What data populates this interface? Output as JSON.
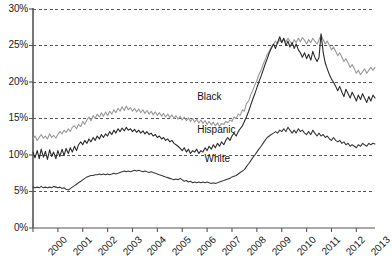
{
  "chart_data": {
    "type": "line",
    "title": "",
    "subtitle": "",
    "xlabel": "",
    "ylabel": "",
    "xlim": [
      2000,
      2013.75
    ],
    "ylim": [
      0,
      30
    ],
    "y_tick_labels": [
      "0%",
      "5%",
      "10%",
      "15%",
      "20%",
      "25%",
      "30%"
    ],
    "y_tick_values": [
      0,
      5,
      10,
      15,
      20,
      25,
      30
    ],
    "x_tick_labels": [
      "2000",
      "2001",
      "2002",
      "2003",
      "2004",
      "2005",
      "2006",
      "2007",
      "2008",
      "2009",
      "2010",
      "2011",
      "2012",
      "2013"
    ],
    "x_tick_values": [
      2000,
      2001,
      2002,
      2003,
      2004,
      2005,
      2006,
      2007,
      2008,
      2009,
      2010,
      2011,
      2012,
      2013
    ],
    "grid": "horizontal-dashed",
    "legend": "inline-labels",
    "colors": {
      "black_series": "#9a9a9a",
      "hispanic_series": "#2b2b2b",
      "white_series": "#3a3a3a",
      "axis": "#555555",
      "grid": "#444444"
    },
    "annotations": [
      {
        "text": "Black",
        "x": 2006.6,
        "y": 17.9
      },
      {
        "text": "Hispanic",
        "x": 2006.6,
        "y": 13.4
      },
      {
        "text": "White",
        "x": 2006.9,
        "y": 9.4
      }
    ],
    "series": [
      {
        "name": "Black",
        "color": "#9a9a9a",
        "x": [
          2000.0,
          2000.08,
          2000.17,
          2000.25,
          2000.33,
          2000.42,
          2000.5,
          2000.58,
          2000.67,
          2000.75,
          2000.83,
          2000.92,
          2001.0,
          2001.08,
          2001.17,
          2001.25,
          2001.33,
          2001.42,
          2001.5,
          2001.58,
          2001.67,
          2001.75,
          2001.83,
          2001.92,
          2002.0,
          2002.08,
          2002.17,
          2002.25,
          2002.33,
          2002.42,
          2002.5,
          2002.58,
          2002.67,
          2002.75,
          2002.83,
          2002.92,
          2003.0,
          2003.08,
          2003.17,
          2003.25,
          2003.33,
          2003.42,
          2003.5,
          2003.58,
          2003.67,
          2003.75,
          2003.83,
          2003.92,
          2004.0,
          2004.08,
          2004.17,
          2004.25,
          2004.33,
          2004.42,
          2004.5,
          2004.58,
          2004.67,
          2004.75,
          2004.83,
          2004.92,
          2005.0,
          2005.08,
          2005.17,
          2005.25,
          2005.33,
          2005.42,
          2005.5,
          2005.58,
          2005.67,
          2005.75,
          2005.83,
          2005.92,
          2006.0,
          2006.08,
          2006.17,
          2006.25,
          2006.33,
          2006.42,
          2006.5,
          2006.58,
          2006.67,
          2006.75,
          2006.83,
          2006.92,
          2007.0,
          2007.08,
          2007.17,
          2007.25,
          2007.33,
          2007.42,
          2007.5,
          2007.58,
          2007.67,
          2007.75,
          2007.83,
          2007.92,
          2008.0,
          2008.08,
          2008.17,
          2008.25,
          2008.33,
          2008.42,
          2008.5,
          2008.58,
          2008.67,
          2008.75,
          2008.83,
          2008.92,
          2009.0,
          2009.08,
          2009.17,
          2009.25,
          2009.33,
          2009.42,
          2009.5,
          2009.58,
          2009.67,
          2009.75,
          2009.83,
          2009.92,
          2010.0,
          2010.08,
          2010.17,
          2010.25,
          2010.33,
          2010.42,
          2010.5,
          2010.58,
          2010.67,
          2010.75,
          2010.83,
          2010.92,
          2011.0,
          2011.08,
          2011.17,
          2011.25,
          2011.33,
          2011.42,
          2011.5,
          2011.58,
          2011.67,
          2011.75,
          2011.83,
          2011.92,
          2012.0,
          2012.08,
          2012.17,
          2012.25,
          2012.33,
          2012.42,
          2012.5,
          2012.58,
          2012.67,
          2012.75,
          2012.83,
          2012.92,
          2013.0,
          2013.08,
          2013.17,
          2013.25,
          2013.33,
          2013.42,
          2013.5,
          2013.58,
          2013.67,
          2013.75
        ],
        "y": [
          12.2,
          12.6,
          12.0,
          12.4,
          12.8,
          12.3,
          12.6,
          12.2,
          12.9,
          12.4,
          12.7,
          12.3,
          12.8,
          13.2,
          12.9,
          13.4,
          13.1,
          13.6,
          13.2,
          13.8,
          14.0,
          13.6,
          14.2,
          13.9,
          14.6,
          14.2,
          14.8,
          15.2,
          14.7,
          15.4,
          15.0,
          15.6,
          15.2,
          15.8,
          15.3,
          15.9,
          15.4,
          16.0,
          15.6,
          16.2,
          15.8,
          16.4,
          16.0,
          16.6,
          16.1,
          16.7,
          16.2,
          16.5,
          16.0,
          16.4,
          15.9,
          16.3,
          15.8,
          16.2,
          15.7,
          16.1,
          15.6,
          16.0,
          15.5,
          15.9,
          15.4,
          15.8,
          15.3,
          15.7,
          15.2,
          15.6,
          15.1,
          15.5,
          15.0,
          15.4,
          14.9,
          15.3,
          14.8,
          15.2,
          14.7,
          15.1,
          14.6,
          15.0,
          14.5,
          14.9,
          14.4,
          14.8,
          14.3,
          14.7,
          14.2,
          14.6,
          14.1,
          14.5,
          14.0,
          14.4,
          13.9,
          14.3,
          14.2,
          14.6,
          14.4,
          14.8,
          14.6,
          15.2,
          15.0,
          15.6,
          15.4,
          16.2,
          16.0,
          17.0,
          17.4,
          18.2,
          18.8,
          19.6,
          20.2,
          21.0,
          21.6,
          22.4,
          23.0,
          23.8,
          24.2,
          24.8,
          25.2,
          25.6,
          25.2,
          25.8,
          25.4,
          25.9,
          25.5,
          26.0,
          25.6,
          25.2,
          25.8,
          25.4,
          26.0,
          25.5,
          26.1,
          25.7,
          25.2,
          25.8,
          25.4,
          26.0,
          25.6,
          25.2,
          25.8,
          26.4,
          25.8,
          25.2,
          25.6,
          25.0,
          24.4,
          24.8,
          24.2,
          23.6,
          24.0,
          23.4,
          22.8,
          23.2,
          22.6,
          22.0,
          22.4,
          21.8,
          21.2,
          21.6,
          21.0,
          21.4,
          21.8,
          21.2,
          21.6,
          22.0,
          21.6,
          22.0
        ]
      },
      {
        "name": "Hispanic",
        "color": "#2b2b2b",
        "x": [
          2000.0,
          2000.08,
          2000.17,
          2000.25,
          2000.33,
          2000.42,
          2000.5,
          2000.58,
          2000.67,
          2000.75,
          2000.83,
          2000.92,
          2001.0,
          2001.08,
          2001.17,
          2001.25,
          2001.33,
          2001.42,
          2001.5,
          2001.58,
          2001.67,
          2001.75,
          2001.83,
          2001.92,
          2002.0,
          2002.08,
          2002.17,
          2002.25,
          2002.33,
          2002.42,
          2002.5,
          2002.58,
          2002.67,
          2002.75,
          2002.83,
          2002.92,
          2003.0,
          2003.08,
          2003.17,
          2003.25,
          2003.33,
          2003.42,
          2003.5,
          2003.58,
          2003.67,
          2003.75,
          2003.83,
          2003.92,
          2004.0,
          2004.08,
          2004.17,
          2004.25,
          2004.33,
          2004.42,
          2004.5,
          2004.58,
          2004.67,
          2004.75,
          2004.83,
          2004.92,
          2005.0,
          2005.08,
          2005.17,
          2005.25,
          2005.33,
          2005.42,
          2005.5,
          2005.58,
          2005.67,
          2005.75,
          2005.83,
          2005.92,
          2006.0,
          2006.08,
          2006.17,
          2006.25,
          2006.33,
          2006.42,
          2006.5,
          2006.58,
          2006.67,
          2006.75,
          2006.83,
          2006.92,
          2007.0,
          2007.08,
          2007.17,
          2007.25,
          2007.33,
          2007.42,
          2007.5,
          2007.58,
          2007.67,
          2007.75,
          2007.83,
          2007.92,
          2008.0,
          2008.08,
          2008.17,
          2008.25,
          2008.33,
          2008.42,
          2008.5,
          2008.58,
          2008.67,
          2008.75,
          2008.83,
          2008.92,
          2009.0,
          2009.08,
          2009.17,
          2009.25,
          2009.33,
          2009.42,
          2009.5,
          2009.58,
          2009.67,
          2009.75,
          2009.83,
          2009.92,
          2010.0,
          2010.08,
          2010.17,
          2010.25,
          2010.33,
          2010.42,
          2010.5,
          2010.58,
          2010.67,
          2010.75,
          2010.83,
          2010.92,
          2011.0,
          2011.08,
          2011.17,
          2011.25,
          2011.33,
          2011.42,
          2011.5,
          2011.58,
          2011.67,
          2011.75,
          2011.83,
          2011.92,
          2012.0,
          2012.08,
          2012.17,
          2012.25,
          2012.33,
          2012.42,
          2012.5,
          2012.58,
          2012.67,
          2012.75,
          2012.83,
          2012.92,
          2013.0,
          2013.08,
          2013.17,
          2013.25,
          2013.33,
          2013.42,
          2013.5,
          2013.58,
          2013.67,
          2013.75
        ],
        "y": [
          10.4,
          9.6,
          10.6,
          9.5,
          10.8,
          9.7,
          10.5,
          9.4,
          10.7,
          9.8,
          10.4,
          9.5,
          10.6,
          9.8,
          10.8,
          9.9,
          10.9,
          10.2,
          11.0,
          10.4,
          11.2,
          10.6,
          11.4,
          11.8,
          11.4,
          12.0,
          11.6,
          12.2,
          11.8,
          12.4,
          12.0,
          12.6,
          12.2,
          12.8,
          12.4,
          12.9,
          12.6,
          13.2,
          12.8,
          13.4,
          13.0,
          13.6,
          13.2,
          13.7,
          13.3,
          13.8,
          13.4,
          13.6,
          13.2,
          13.5,
          13.1,
          13.4,
          13.0,
          13.3,
          12.9,
          13.2,
          12.8,
          13.0,
          12.6,
          12.8,
          12.4,
          12.6,
          12.2,
          12.4,
          12.0,
          12.2,
          11.8,
          12.0,
          11.6,
          11.4,
          11.2,
          10.9,
          10.6,
          11.0,
          10.4,
          10.8,
          10.2,
          10.6,
          10.4,
          10.8,
          10.2,
          10.6,
          10.4,
          11.0,
          10.6,
          11.2,
          10.8,
          11.4,
          11.0,
          11.6,
          11.2,
          11.8,
          11.4,
          12.0,
          12.4,
          12.0,
          12.6,
          13.0,
          12.6,
          13.2,
          13.6,
          14.0,
          14.6,
          15.2,
          16.0,
          16.8,
          17.6,
          18.4,
          19.2,
          20.0,
          20.8,
          21.6,
          22.4,
          23.2,
          24.0,
          24.6,
          25.2,
          24.6,
          25.4,
          26.2,
          25.4,
          26.0,
          25.0,
          25.6,
          24.8,
          25.4,
          24.6,
          25.2,
          24.4,
          24.0,
          23.4,
          24.0,
          23.2,
          23.8,
          23.0,
          24.2,
          23.4,
          22.8,
          23.4,
          26.6,
          24.0,
          22.6,
          21.8,
          21.0,
          20.4,
          20.0,
          19.4,
          18.8,
          19.4,
          18.6,
          18.0,
          19.0,
          18.4,
          17.8,
          18.6,
          18.0,
          17.4,
          18.2,
          17.6,
          18.4,
          17.8,
          17.2,
          18.0,
          17.4,
          18.2,
          17.8
        ]
      },
      {
        "name": "White",
        "color": "#3a3a3a",
        "x": [
          2000.0,
          2000.08,
          2000.17,
          2000.25,
          2000.33,
          2000.42,
          2000.5,
          2000.58,
          2000.67,
          2000.75,
          2000.83,
          2000.92,
          2001.0,
          2001.08,
          2001.17,
          2001.25,
          2001.33,
          2001.42,
          2001.5,
          2001.58,
          2001.67,
          2001.75,
          2001.83,
          2001.92,
          2002.0,
          2002.08,
          2002.17,
          2002.25,
          2002.33,
          2002.42,
          2002.5,
          2002.58,
          2002.67,
          2002.75,
          2002.83,
          2002.92,
          2003.0,
          2003.08,
          2003.17,
          2003.25,
          2003.33,
          2003.42,
          2003.5,
          2003.58,
          2003.67,
          2003.75,
          2003.83,
          2003.92,
          2004.0,
          2004.08,
          2004.17,
          2004.25,
          2004.33,
          2004.42,
          2004.5,
          2004.58,
          2004.67,
          2004.75,
          2004.83,
          2004.92,
          2005.0,
          2005.08,
          2005.17,
          2005.25,
          2005.33,
          2005.42,
          2005.5,
          2005.58,
          2005.67,
          2005.75,
          2005.83,
          2005.92,
          2006.0,
          2006.08,
          2006.17,
          2006.25,
          2006.33,
          2006.42,
          2006.5,
          2006.58,
          2006.67,
          2006.75,
          2006.83,
          2006.92,
          2007.0,
          2007.08,
          2007.17,
          2007.25,
          2007.33,
          2007.42,
          2007.5,
          2007.58,
          2007.67,
          2007.75,
          2007.83,
          2007.92,
          2008.0,
          2008.08,
          2008.17,
          2008.25,
          2008.33,
          2008.42,
          2008.5,
          2008.58,
          2008.67,
          2008.75,
          2008.83,
          2008.92,
          2009.0,
          2009.08,
          2009.17,
          2009.25,
          2009.33,
          2009.42,
          2009.5,
          2009.58,
          2009.67,
          2009.75,
          2009.83,
          2009.92,
          2010.0,
          2010.08,
          2010.17,
          2010.25,
          2010.33,
          2010.42,
          2010.5,
          2010.58,
          2010.67,
          2010.75,
          2010.83,
          2010.92,
          2011.0,
          2011.08,
          2011.17,
          2011.25,
          2011.33,
          2011.42,
          2011.5,
          2011.58,
          2011.67,
          2011.75,
          2011.83,
          2011.92,
          2012.0,
          2012.08,
          2012.17,
          2012.25,
          2012.33,
          2012.42,
          2012.5,
          2012.58,
          2012.67,
          2012.75,
          2012.83,
          2012.92,
          2013.0,
          2013.08,
          2013.17,
          2013.25,
          2013.33,
          2013.42,
          2013.5,
          2013.58,
          2013.67,
          2013.75
        ],
        "y": [
          5.6,
          5.5,
          5.6,
          5.5,
          5.7,
          5.5,
          5.6,
          5.5,
          5.6,
          5.5,
          5.7,
          5.6,
          5.5,
          5.6,
          5.4,
          5.5,
          5.3,
          5.2,
          5.4,
          5.6,
          5.8,
          6.0,
          6.2,
          6.4,
          6.6,
          6.8,
          7.0,
          7.1,
          7.2,
          7.2,
          7.3,
          7.3,
          7.4,
          7.3,
          7.4,
          7.3,
          7.4,
          7.3,
          7.4,
          7.5,
          7.4,
          7.5,
          7.6,
          7.7,
          7.8,
          7.7,
          7.8,
          7.7,
          7.8,
          7.9,
          7.8,
          7.9,
          7.8,
          7.7,
          7.8,
          7.7,
          7.6,
          7.7,
          7.6,
          7.5,
          7.4,
          7.3,
          7.2,
          7.1,
          7.0,
          6.9,
          6.8,
          6.7,
          6.6,
          6.7,
          6.6,
          6.8,
          6.6,
          6.4,
          6.5,
          6.3,
          6.4,
          6.2,
          6.3,
          6.2,
          6.3,
          6.2,
          6.3,
          6.2,
          6.3,
          6.2,
          6.1,
          6.2,
          6.1,
          6.2,
          6.3,
          6.4,
          6.5,
          6.6,
          6.7,
          6.8,
          7.0,
          7.1,
          7.2,
          7.4,
          7.6,
          7.8,
          8.0,
          8.4,
          8.8,
          9.2,
          9.6,
          10.0,
          10.4,
          10.8,
          11.2,
          11.6,
          12.0,
          12.4,
          12.6,
          12.8,
          13.0,
          13.2,
          13.0,
          13.4,
          13.2,
          13.6,
          13.2,
          13.8,
          13.4,
          13.0,
          13.4,
          13.0,
          13.6,
          13.2,
          13.4,
          13.0,
          12.8,
          13.2,
          12.8,
          13.4,
          13.0,
          12.6,
          13.0,
          12.6,
          12.8,
          12.4,
          12.6,
          12.2,
          12.0,
          12.4,
          12.0,
          11.8,
          12.0,
          11.6,
          11.8,
          11.4,
          11.6,
          11.2,
          11.4,
          11.2,
          11.0,
          11.4,
          11.2,
          11.6,
          11.4,
          11.2,
          11.6,
          11.4,
          11.6,
          11.5
        ]
      }
    ]
  }
}
